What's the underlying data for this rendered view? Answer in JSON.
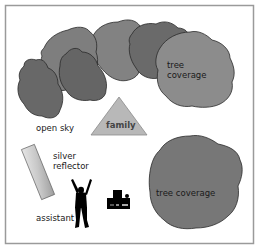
{
  "diagram": {
    "type": "photography lighting setup",
    "colors": {
      "background": "#ffffff",
      "frame": "#9a9a9a",
      "tree_dark": "#686868",
      "tree_mid": "#7a7a7a",
      "tree_light": "#8a8a8a",
      "tree_outline": "#2a2a2a",
      "triangle_fill": "#b8b8b8",
      "triangle_stroke": "#8a8a8a",
      "reflector_light": "#e4e4e4",
      "reflector_dark": "#a8a8a8",
      "silhouette": "#000000",
      "text": "#1a1a1a"
    },
    "labels": {
      "tree_top": [
        "tree",
        "coverage"
      ],
      "tree_bottom": "tree coverage",
      "open_sky": "open sky",
      "family": "family",
      "reflector": [
        "silver",
        "reflector"
      ],
      "assistant": "assistant"
    },
    "icons": {
      "assistant": "person-arms-raised-silhouette",
      "camera": "camera-silhouette",
      "reflector": "reflector-panel",
      "subject": "triangle-subject-marker"
    }
  }
}
